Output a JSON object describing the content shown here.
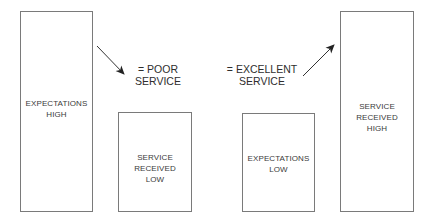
{
  "diagram": {
    "left_comparison": {
      "expectations_box": {
        "lines": [
          "EXPECTATIONS",
          "HIGH"
        ],
        "relative_height": "tall"
      },
      "service_box": {
        "lines": [
          "SERVICE",
          "RECEIVED",
          "LOW"
        ],
        "relative_height": "short"
      },
      "result": {
        "lines": [
          "= POOR",
          "SERVICE"
        ],
        "arrow_direction": "down-right"
      }
    },
    "right_comparison": {
      "expectations_box": {
        "lines": [
          "EXPECTATIONS",
          "LOW"
        ],
        "relative_height": "short"
      },
      "service_box": {
        "lines": [
          "SERVICE",
          "RECEIVED",
          "HIGH"
        ],
        "relative_height": "tall"
      },
      "result": {
        "lines": [
          "= EXCELLENT",
          "SERVICE"
        ],
        "arrow_direction": "up-right"
      }
    },
    "colors": {
      "box_border": "#7a7a7a",
      "text": "#333333",
      "arrow": "#222222",
      "background": "#ffffff"
    }
  }
}
